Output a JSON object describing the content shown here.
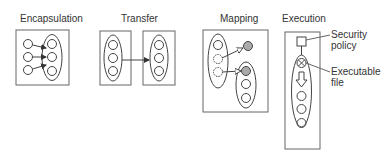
{
  "panels": [
    {
      "id": "encapsulation",
      "title": "Encapsulation"
    },
    {
      "id": "transfer",
      "title": "Transfer"
    },
    {
      "id": "mapping",
      "title": "Mapping"
    },
    {
      "id": "execution",
      "title": "Execution"
    }
  ],
  "execution_annotations": {
    "security_policy": [
      "Security",
      "policy"
    ],
    "executable_file": [
      "Executable",
      "file"
    ]
  },
  "colors": {
    "stroke": "#444444",
    "frame": "#666666",
    "shaded_node": "#999999"
  }
}
